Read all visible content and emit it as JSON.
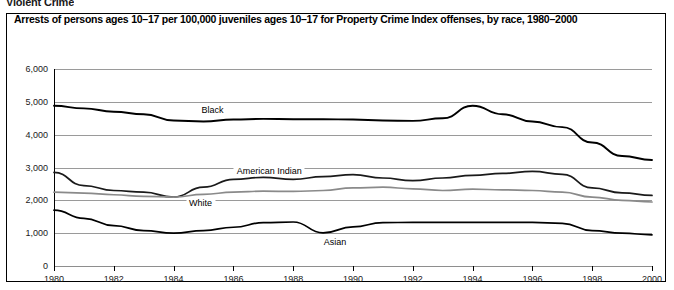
{
  "page": {
    "running_head": "Violent Crime"
  },
  "figure": {
    "title": "Arrests of persons ages 10–17 per 100,000 juveniles ages 10–17 for Property Crime Index offenses, by race, 1980–2000"
  },
  "chart_data": {
    "type": "line",
    "title": "Arrests of persons ages 10–17 per 100,000 juveniles ages 10–17 for Property Crime Index offenses, by race, 1980–2000",
    "xlabel": "",
    "ylabel": "",
    "xlim": [
      1980,
      2000
    ],
    "ylim": [
      0,
      6000
    ],
    "grid": true,
    "legend": "inline-labels",
    "x": [
      1980,
      1981,
      1982,
      1983,
      1984,
      1985,
      1986,
      1987,
      1988,
      1989,
      1990,
      1991,
      1992,
      1993,
      1994,
      1995,
      1996,
      1997,
      1998,
      1999,
      2000
    ],
    "y_ticks": [
      0,
      1000,
      2000,
      3000,
      4000,
      5000,
      6000
    ],
    "y_tick_labels": [
      "0",
      "1,000",
      "2,000",
      "3,000",
      "4,000",
      "5,000",
      "6,000"
    ],
    "x_ticks": [
      1980,
      1982,
      1984,
      1986,
      1988,
      1990,
      1992,
      1994,
      1996,
      1998,
      2000
    ],
    "x_tick_labels": [
      "1980",
      "1982",
      "1984",
      "1986",
      "1988",
      "1990",
      "1992",
      "1994",
      "1996",
      "1998",
      "2000"
    ],
    "series": [
      {
        "name": "Black",
        "color": "#000000",
        "width": 1.9,
        "label_x": 1985.3,
        "label_y": 4750,
        "values": [
          4880,
          4800,
          4700,
          4620,
          4430,
          4400,
          4460,
          4480,
          4470,
          4470,
          4460,
          4430,
          4420,
          4500,
          4880,
          4620,
          4400,
          4230,
          3760,
          3350,
          3230
        ]
      },
      {
        "name": "American Indian",
        "color": "#1a1a1a",
        "width": 1.7,
        "label_x": 1987.2,
        "label_y": 2880,
        "values": [
          2850,
          2450,
          2300,
          2250,
          2100,
          2400,
          2640,
          2700,
          2640,
          2720,
          2780,
          2680,
          2600,
          2680,
          2760,
          2820,
          2880,
          2790,
          2380,
          2230,
          2150
        ]
      },
      {
        "name": "White",
        "color": "#8a8a8a",
        "width": 1.7,
        "label_x": 1984.9,
        "label_y": 1930,
        "values": [
          2250,
          2220,
          2170,
          2120,
          2100,
          2180,
          2250,
          2280,
          2270,
          2300,
          2380,
          2400,
          2350,
          2300,
          2340,
          2320,
          2300,
          2250,
          2100,
          2000,
          1950
        ]
      },
      {
        "name": "Asian",
        "color": "#000000",
        "width": 1.7,
        "label_x": 1989.4,
        "label_y": 740,
        "values": [
          1700,
          1450,
          1230,
          1080,
          1000,
          1080,
          1180,
          1320,
          1340,
          1010,
          1190,
          1320,
          1330,
          1330,
          1330,
          1330,
          1330,
          1300,
          1080,
          1000,
          950
        ]
      }
    ]
  }
}
